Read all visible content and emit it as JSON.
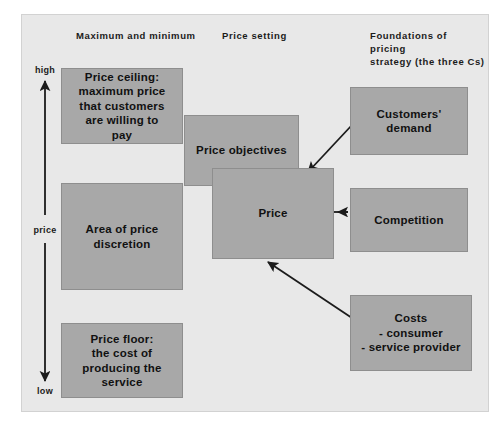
{
  "figure": {
    "panel_background": "#e8e8e8",
    "box_fill": "#a8a8a8",
    "box_border": "#8e8e8e",
    "text_color": "#111111"
  },
  "columns": {
    "left_heading": "Maximum and minimum",
    "middle_heading": "Price setting",
    "right_heading": "Foundations of pricing\nstrategy (the three Cs)"
  },
  "axis": {
    "top_label": "high",
    "middle_label": "price",
    "bottom_label": "low"
  },
  "boxes": {
    "price_ceiling": "Price ceiling:\nmaximum price\nthat customers\nare willing to\npay",
    "area_of_price_discretion": "Area of price\ndiscretion",
    "price_floor": "Price floor:\nthe cost of\nproducing the\nservice",
    "price_objectives": "Price objectives",
    "price": "Price",
    "customers_demand": "Customers'\ndemand",
    "competition": "Competition",
    "costs": "Costs\n- consumer\n- service provider"
  }
}
